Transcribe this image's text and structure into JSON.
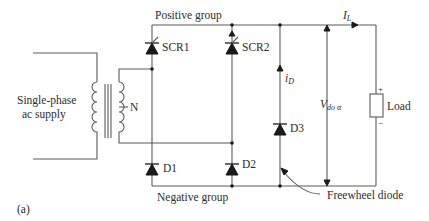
{
  "figure": {
    "panel_label": "(a)",
    "groups": {
      "positive": "Positive group",
      "negative": "Negative group"
    },
    "source": {
      "line1": "Single-phase",
      "line2": "ac supply"
    },
    "transformer": {
      "center_tap_label": "N"
    },
    "devices": {
      "scr1": "SCR1",
      "scr2": "SCR2",
      "d1": "D1",
      "d2": "D2",
      "d3": "D3"
    },
    "currents": {
      "load_current": "I",
      "load_current_sub": "L",
      "diode_current": "i",
      "diode_current_sub": "D"
    },
    "voltage": {
      "symbol": "V",
      "subscript": "do α"
    },
    "load": {
      "label": "Load",
      "plus": "+",
      "minus": "−"
    },
    "annotation": {
      "freewheel": "Freewheel diode"
    }
  }
}
